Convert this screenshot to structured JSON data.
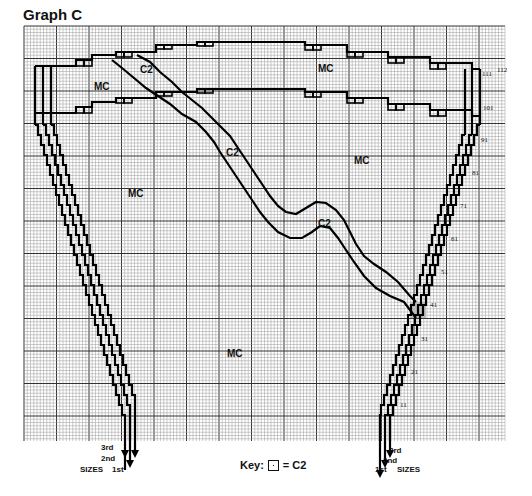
{
  "title": "Graph C",
  "grid": {
    "left": 24,
    "top": 26,
    "right": 505,
    "bottom": 441,
    "minor": 3.25,
    "major_every": 10,
    "minor_color": "#9a9a9a",
    "major_color": "#333333"
  },
  "region_labels": [
    {
      "text": "MC",
      "x": 94,
      "y": 90
    },
    {
      "text": "C2",
      "x": 140,
      "y": 73
    },
    {
      "text": "MC",
      "x": 318,
      "y": 72
    },
    {
      "text": "C2",
      "x": 226,
      "y": 156
    },
    {
      "text": "MC",
      "x": 354,
      "y": 164
    },
    {
      "text": "MC",
      "x": 128,
      "y": 197
    },
    {
      "text": "C2",
      "x": 318,
      "y": 227
    },
    {
      "text": "MC",
      "x": 227,
      "y": 357
    }
  ],
  "row_markers": [
    {
      "text": "112",
      "x": 497,
      "y": 72
    },
    {
      "text": "111",
      "x": 482,
      "y": 76
    },
    {
      "text": "101",
      "x": 483,
      "y": 110
    },
    {
      "text": "91",
      "x": 481,
      "y": 142
    },
    {
      "text": "81",
      "x": 472,
      "y": 175
    },
    {
      "text": "71",
      "x": 460,
      "y": 208
    },
    {
      "text": "61",
      "x": 451,
      "y": 241
    },
    {
      "text": "51",
      "x": 441,
      "y": 274
    },
    {
      "text": "41",
      "x": 430,
      "y": 307
    },
    {
      "text": "31",
      "x": 421,
      "y": 341
    },
    {
      "text": "21",
      "x": 411,
      "y": 374
    },
    {
      "text": "11",
      "x": 400,
      "y": 407
    }
  ],
  "left_sizes": {
    "sizes_label": "SIZES",
    "third": "3rd",
    "second": "2nd",
    "first": "1st"
  },
  "right_sizes": {
    "sizes_label": "SIZES",
    "third": "3rd",
    "second": "2nd",
    "first": "1st"
  },
  "key": {
    "prefix": "Key:",
    "suffix": "= C2"
  }
}
